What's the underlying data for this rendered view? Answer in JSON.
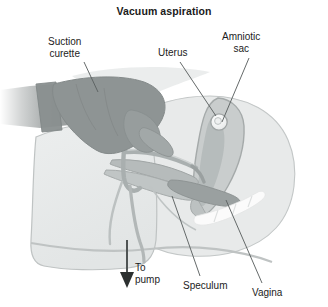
{
  "figure": {
    "title": "Vacuum aspiration",
    "type": "medical-illustration",
    "style": "grayscale line drawing",
    "colors": {
      "background": "#ffffff",
      "text": "#1c1c1c",
      "body_fill": "#e6e8e8",
      "body_outline": "#b9bdbd",
      "arm_fill": "#9a9f9f",
      "glove_fill": "#8e9494",
      "uterus_fill": "#c9cdcd",
      "uterus_outline": "#a8adad",
      "amniotic_fill": "#f2f3f3",
      "instrument_fill": "#b0b5b5",
      "speculum_white": "#fbfbfb",
      "leader_line": "#5a5f5f"
    }
  },
  "labels": [
    {
      "id": "suction-curette",
      "line1": "Suction",
      "line2": "curette"
    },
    {
      "id": "uterus",
      "line1": "Uterus",
      "line2": ""
    },
    {
      "id": "amniotic-sac",
      "line1": "Amniotic",
      "line2": "sac"
    },
    {
      "id": "to-pump",
      "line1": "To",
      "line2": "pump"
    },
    {
      "id": "speculum",
      "line1": "Speculum",
      "line2": ""
    },
    {
      "id": "vagina",
      "line1": "Vagina",
      "line2": ""
    }
  ],
  "label_text": {
    "suction_curette_l1": "Suction",
    "suction_curette_l2": "curette",
    "uterus": "Uterus",
    "amniotic_sac_l1": "Amniotic",
    "amniotic_sac_l2": "sac",
    "to_pump_l1": "To",
    "to_pump_l2": "pump",
    "speculum": "Speculum",
    "vagina": "Vagina"
  },
  "annotations": {
    "flow_arrow_direction": "down",
    "flow_arrow_meaning": "suction tubing leads to vacuum pump"
  }
}
